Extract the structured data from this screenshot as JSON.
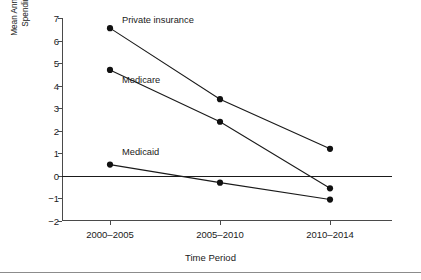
{
  "chart_data": {
    "type": "line",
    "title": "",
    "xlabel": "Time Period",
    "ylabel_line1": "Mean Annual Percentage Change in",
    "ylabel_line2": "Spending, Adjusted for Inflation",
    "categories": [
      "2000–2005",
      "2005–2010",
      "2010–2014"
    ],
    "ylim": [
      -2,
      7
    ],
    "yticks": [
      -2,
      -1,
      0,
      1,
      2,
      3,
      4,
      5,
      6,
      7
    ],
    "ytick_labels": [
      "−2",
      "−1",
      "0",
      "1",
      "2",
      "3",
      "4",
      "5",
      "6",
      "7"
    ],
    "grid": false,
    "legend_position": "inline-annotations",
    "zero_reference_line": 0,
    "series": [
      {
        "name": "Private insurance",
        "values": [
          6.55,
          3.4,
          1.2
        ],
        "label_x_category_index": 0,
        "label_value": 6.9
      },
      {
        "name": "Medicare",
        "values": [
          4.7,
          2.4,
          -0.55
        ],
        "label_x_category_index": 0,
        "label_value": 4.25
      },
      {
        "name": "Medicaid",
        "values": [
          0.5,
          -0.3,
          -1.05
        ],
        "label_x_category_index": 0,
        "label_value": 1.05
      }
    ]
  },
  "axis": {
    "x_title": "Time Period"
  }
}
